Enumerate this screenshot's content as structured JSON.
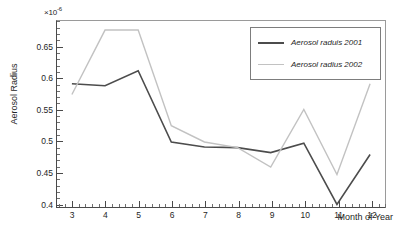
{
  "chart_data": {
    "type": "line",
    "title": "",
    "xlabel": "Month of Year",
    "ylabel": "Aerosol Radius",
    "y_multiplier": "×10",
    "y_exponent": "-6",
    "xlim": [
      2.55,
      12.45
    ],
    "ylim": [
      0.393,
      0.6905
    ],
    "grid": false,
    "legend_position": "top-right",
    "categories": [
      3,
      4,
      5,
      6,
      7,
      8,
      9,
      10,
      11,
      12
    ],
    "xticks": [
      "3",
      "4",
      "5",
      "6",
      "7",
      "8",
      "9",
      "10",
      "11",
      "12"
    ],
    "yticks": [
      "0.4",
      "0.45",
      "0.5",
      "0.55",
      "0.6",
      "0.65"
    ],
    "ytick_values": [
      0.4,
      0.45,
      0.5,
      0.55,
      0.6,
      0.65
    ],
    "series": [
      {
        "name": "Aerosol raduis 2001",
        "color": "#4c4c4c",
        "width": 1.6,
        "values": [
          0.59,
          0.587,
          0.611,
          0.497,
          0.489,
          0.488,
          0.48,
          0.495,
          0.397,
          0.477
        ]
      },
      {
        "name": "Aerosol radius 2002",
        "color": "#c2c2c2",
        "width": 1.4,
        "values": [
          0.573,
          0.676,
          0.676,
          0.523,
          0.497,
          0.488,
          0.457,
          0.549,
          0.445,
          0.59
        ]
      }
    ]
  },
  "legend": {
    "entries": [
      {
        "label": "Aerosol raduis 2001"
      },
      {
        "label": "Aerosol radius 2002"
      }
    ]
  },
  "axes": {
    "y_title": "Aerosol Radius",
    "x_title": "Month of Year"
  }
}
